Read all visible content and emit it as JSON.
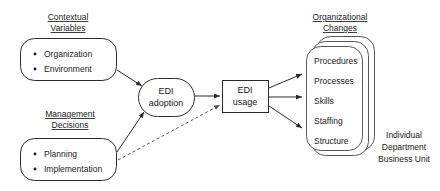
{
  "diagram": {
    "headings": {
      "contextual": {
        "line1": "Contextual",
        "line2": "Variables"
      },
      "management": {
        "line1": "Management",
        "line2": "Decisions"
      },
      "organizational": {
        "line1": "Organizational",
        "line2": "Changes"
      }
    },
    "contextual_box": {
      "items": [
        "Organization",
        "Environment"
      ]
    },
    "management_box": {
      "items": [
        "Planning",
        "Implementation"
      ]
    },
    "adoption_node": {
      "line1": "EDI",
      "line2": "adoption"
    },
    "usage_node": {
      "line1": "EDI",
      "line2": "usage"
    },
    "changes_stack": {
      "items": [
        "Procedures",
        "Processes",
        "Skills",
        "Staffing",
        "Structure"
      ]
    },
    "caption": {
      "line1": "Individual",
      "line2": "Department",
      "line3": "Business Unit"
    },
    "colors": {
      "stroke": "#2b2b2b",
      "stack_stroke": "#555555",
      "text": "#1a1a1a",
      "background": "#ffffff"
    }
  }
}
